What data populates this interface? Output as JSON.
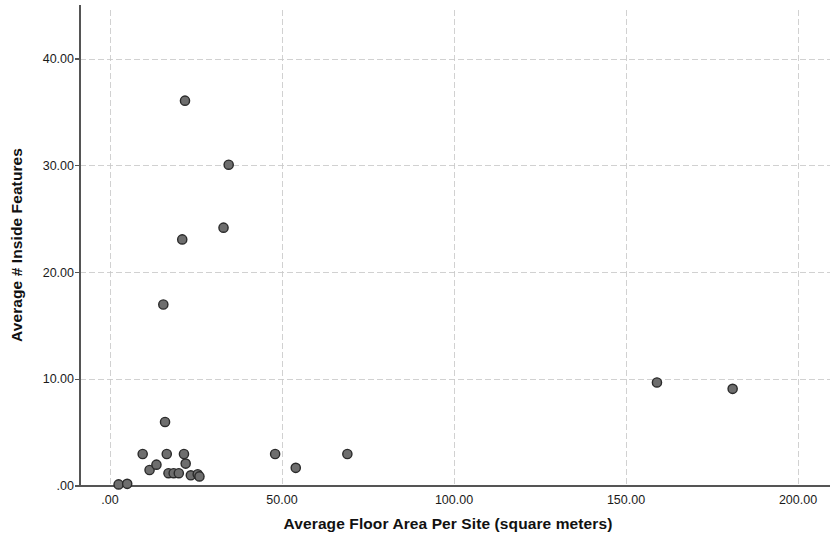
{
  "chart_data": {
    "type": "scatter",
    "title": "",
    "xlabel": "Average Floor Area Per Site (square meters)",
    "ylabel": "Average # Inside Features",
    "xlim": [
      -9,
      210
    ],
    "ylim": [
      -1.5,
      44
    ],
    "grid": true,
    "legend": false,
    "xticks": [
      {
        "value": 0,
        "label": ".00"
      },
      {
        "value": 50,
        "label": "50.00"
      },
      {
        "value": 100,
        "label": "100.00"
      },
      {
        "value": 150,
        "label": "150.00"
      },
      {
        "value": 200,
        "label": "200.00"
      }
    ],
    "yticks": [
      {
        "value": 0,
        "label": ".00"
      },
      {
        "value": 10,
        "label": "10.00"
      },
      {
        "value": 20,
        "label": "20.00"
      },
      {
        "value": 30,
        "label": "30.00"
      },
      {
        "value": 40,
        "label": "40.00"
      }
    ],
    "marker": {
      "shape": "circle",
      "fill": "#6e6e6e",
      "edge": "#2a2a2a",
      "radius_px": 4.6
    },
    "points": [
      {
        "x": 2.5,
        "y": 0.15
      },
      {
        "x": 5.0,
        "y": 0.2
      },
      {
        "x": 9.5,
        "y": 3.0
      },
      {
        "x": 11.5,
        "y": 1.5
      },
      {
        "x": 13.5,
        "y": 2.0
      },
      {
        "x": 15.5,
        "y": 17.0
      },
      {
        "x": 16.0,
        "y": 6.0
      },
      {
        "x": 16.5,
        "y": 3.0
      },
      {
        "x": 17.0,
        "y": 1.2
      },
      {
        "x": 18.5,
        "y": 1.2
      },
      {
        "x": 20.0,
        "y": 1.2
      },
      {
        "x": 21.0,
        "y": 23.1
      },
      {
        "x": 21.5,
        "y": 3.0
      },
      {
        "x": 21.8,
        "y": 36.1
      },
      {
        "x": 22.0,
        "y": 2.1
      },
      {
        "x": 23.5,
        "y": 1.0
      },
      {
        "x": 25.5,
        "y": 1.1
      },
      {
        "x": 26.0,
        "y": 0.9
      },
      {
        "x": 33.0,
        "y": 24.2
      },
      {
        "x": 34.5,
        "y": 30.1
      },
      {
        "x": 48.0,
        "y": 3.0
      },
      {
        "x": 54.0,
        "y": 1.7
      },
      {
        "x": 69.0,
        "y": 3.0
      },
      {
        "x": 159.0,
        "y": 9.7
      },
      {
        "x": 181.0,
        "y": 9.1
      }
    ]
  },
  "axes": {
    "ylabel_text": "Average # Inside Features",
    "xlabel_text": "Average Floor Area Per Site (square meters)"
  },
  "colors": {
    "marker_fill": "#6e6e6e",
    "marker_edge": "#2a2a2a",
    "gridline": "#c9c9c9",
    "axis": "#555555",
    "text": "#1a1a1a",
    "background": "#ffffff"
  }
}
